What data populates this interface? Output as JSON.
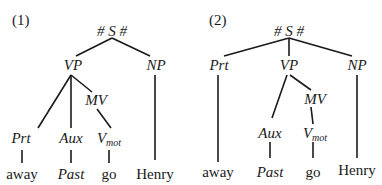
{
  "trees": [
    {
      "id": "1",
      "number_label": "(1)",
      "nodes": {
        "root": "# S #",
        "vp": "VP",
        "np": "NP",
        "mv": "MV",
        "prt": "Prt",
        "aux": "Aux",
        "vmot": "V",
        "vmot_sub": "mot",
        "away": "away",
        "past": "Past",
        "go": "go",
        "henry": "Henry"
      }
    },
    {
      "id": "2",
      "number_label": "(2)",
      "nodes": {
        "root": "# S #",
        "prt": "Prt",
        "vp": "VP",
        "np": "NP",
        "mv": "MV",
        "aux": "Aux",
        "vmot": "V",
        "vmot_sub": "mot",
        "away": "away",
        "past": "Past",
        "go": "go",
        "henry": "Henry"
      }
    }
  ]
}
